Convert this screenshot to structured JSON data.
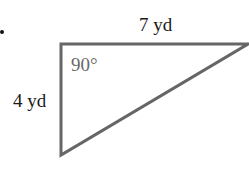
{
  "figure": {
    "type": "right-triangle",
    "vertices": {
      "right_angle": [
        61,
        44
      ],
      "top_right": [
        248,
        44
      ],
      "bottom": [
        61,
        155
      ]
    },
    "line_color": "#666666",
    "labels": {
      "top_side": "7 yd",
      "left_side": "4 yd",
      "angle": "90°"
    }
  }
}
